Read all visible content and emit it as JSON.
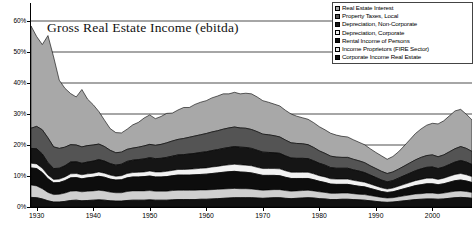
{
  "chart_data": {
    "type": "area",
    "stacked": true,
    "title": "Gross Real Estate Income (ebitda)",
    "xlabel": "",
    "ylabel": "",
    "ylim": [
      0,
      62
    ],
    "yticks": [
      "0%",
      "10%",
      "20%",
      "30%",
      "40%",
      "50%",
      "60%"
    ],
    "ytick_values": [
      0,
      10,
      20,
      30,
      40,
      50,
      60
    ],
    "xticks": [
      "1930",
      "1940",
      "1950",
      "1960",
      "1970",
      "1980",
      "1990",
      "2000"
    ],
    "xtick_values": [
      1930,
      1940,
      1950,
      1960,
      1970,
      1980,
      1990,
      2000
    ],
    "xlim": [
      1929,
      2007
    ],
    "grid": true,
    "legend_position": "top-right",
    "x": [
      1929,
      1930,
      1931,
      1932,
      1933,
      1934,
      1935,
      1936,
      1937,
      1938,
      1939,
      1940,
      1941,
      1942,
      1943,
      1944,
      1945,
      1946,
      1947,
      1948,
      1949,
      1950,
      1951,
      1952,
      1953,
      1954,
      1955,
      1956,
      1957,
      1958,
      1959,
      1960,
      1961,
      1962,
      1963,
      1964,
      1965,
      1966,
      1967,
      1968,
      1969,
      1970,
      1971,
      1972,
      1973,
      1974,
      1975,
      1976,
      1977,
      1978,
      1979,
      1980,
      1981,
      1982,
      1983,
      1984,
      1985,
      1986,
      1987,
      1988,
      1989,
      1990,
      1991,
      1992,
      1993,
      1994,
      1995,
      1996,
      1997,
      1998,
      1999,
      2000,
      2001,
      2002,
      2003,
      2004,
      2005,
      2006,
      2007
    ],
    "series": [
      {
        "name": "Corporate Income Real Estate",
        "fill": "#111111",
        "values": [
          3.1,
          3.0,
          2.6,
          2.0,
          1.6,
          1.6,
          1.8,
          2.1,
          2.2,
          2.0,
          2.1,
          2.2,
          2.3,
          2.2,
          2.0,
          1.9,
          1.9,
          2.1,
          2.2,
          2.2,
          2.2,
          2.3,
          2.2,
          2.2,
          2.2,
          2.3,
          2.4,
          2.4,
          2.4,
          2.4,
          2.5,
          2.5,
          2.6,
          2.7,
          2.8,
          2.9,
          3.0,
          3.0,
          3.0,
          3.0,
          2.9,
          2.8,
          2.9,
          3.0,
          3.0,
          2.8,
          2.7,
          2.8,
          2.9,
          3.0,
          2.9,
          2.7,
          2.6,
          2.4,
          2.4,
          2.5,
          2.5,
          2.4,
          2.3,
          2.2,
          2.0,
          1.8,
          1.6,
          1.5,
          1.6,
          1.8,
          2.0,
          2.2,
          2.4,
          2.5,
          2.6,
          2.6,
          2.5,
          2.6,
          2.8,
          3.0,
          3.1,
          3.0,
          2.8
        ]
      },
      {
        "name": "Income Proprietors (FIRE Sector)",
        "fill": "#cfcfcf",
        "values": [
          4.0,
          3.8,
          3.3,
          2.7,
          2.4,
          2.5,
          2.7,
          3.0,
          3.0,
          2.9,
          3.0,
          3.0,
          3.1,
          3.0,
          2.8,
          2.7,
          2.7,
          2.9,
          3.0,
          3.0,
          3.0,
          3.0,
          2.9,
          2.9,
          2.9,
          3.0,
          3.0,
          3.0,
          3.0,
          3.0,
          3.0,
          3.0,
          3.0,
          3.0,
          3.0,
          3.0,
          3.0,
          2.9,
          2.9,
          2.8,
          2.7,
          2.6,
          2.6,
          2.6,
          2.6,
          2.5,
          2.4,
          2.4,
          2.4,
          2.4,
          2.3,
          2.2,
          2.1,
          2.0,
          2.0,
          2.0,
          2.0,
          1.9,
          1.8,
          1.8,
          1.7,
          1.6,
          1.5,
          1.4,
          1.4,
          1.5,
          1.6,
          1.7,
          1.8,
          1.8,
          1.9,
          1.9,
          1.8,
          1.9,
          2.0,
          2.1,
          2.1,
          2.0,
          1.9
        ]
      },
      {
        "name": "Rental Income of Persons",
        "fill": "#0d0d0d",
        "values": [
          5.5,
          5.6,
          5.2,
          4.4,
          3.8,
          3.8,
          4.0,
          4.3,
          4.3,
          4.2,
          4.3,
          4.4,
          4.5,
          4.4,
          4.2,
          4.1,
          4.2,
          4.4,
          4.5,
          4.5,
          4.6,
          4.7,
          4.6,
          4.6,
          4.7,
          4.8,
          4.9,
          4.9,
          4.9,
          5.0,
          5.0,
          5.1,
          5.2,
          5.3,
          5.4,
          5.5,
          5.5,
          5.4,
          5.3,
          5.2,
          5.0,
          4.8,
          4.7,
          4.6,
          4.5,
          4.3,
          4.1,
          4.0,
          3.9,
          3.8,
          3.6,
          3.4,
          3.2,
          3.0,
          2.9,
          2.8,
          2.8,
          2.7,
          2.6,
          2.5,
          2.3,
          2.1,
          1.9,
          1.8,
          1.9,
          2.1,
          2.3,
          2.5,
          2.7,
          2.9,
          3.0,
          3.0,
          2.9,
          3.0,
          3.2,
          3.4,
          3.5,
          3.4,
          3.2
        ]
      },
      {
        "name": "Depreciation, Corporate",
        "fill": "#f2f2f2",
        "values": [
          1.5,
          1.5,
          1.4,
          1.2,
          1.1,
          1.1,
          1.2,
          1.3,
          1.3,
          1.3,
          1.3,
          1.3,
          1.4,
          1.3,
          1.3,
          1.2,
          1.3,
          1.4,
          1.4,
          1.5,
          1.5,
          1.6,
          1.6,
          1.6,
          1.7,
          1.7,
          1.8,
          1.8,
          1.9,
          1.9,
          2.0,
          2.0,
          2.1,
          2.1,
          2.2,
          2.2,
          2.3,
          2.3,
          2.3,
          2.3,
          2.2,
          2.2,
          2.2,
          2.2,
          2.2,
          2.1,
          2.0,
          2.0,
          2.0,
          2.0,
          1.9,
          1.8,
          1.8,
          1.7,
          1.7,
          1.7,
          1.7,
          1.6,
          1.6,
          1.5,
          1.4,
          1.3,
          1.2,
          1.1,
          1.2,
          1.3,
          1.4,
          1.5,
          1.6,
          1.7,
          1.8,
          1.8,
          1.7,
          1.8,
          1.9,
          2.0,
          2.1,
          2.0,
          1.9
        ]
      },
      {
        "name": "Depreciation, Non-Corporate",
        "fill": "#151515",
        "values": [
          4.8,
          4.9,
          4.6,
          4.0,
          3.5,
          3.5,
          3.6,
          3.8,
          3.8,
          3.7,
          3.8,
          3.9,
          4.0,
          3.9,
          3.7,
          3.6,
          3.7,
          3.9,
          4.0,
          4.1,
          4.2,
          4.3,
          4.3,
          4.4,
          4.5,
          4.6,
          4.7,
          4.8,
          4.9,
          5.0,
          5.1,
          5.2,
          5.3,
          5.4,
          5.5,
          5.6,
          5.7,
          5.7,
          5.7,
          5.6,
          5.5,
          5.3,
          5.2,
          5.1,
          5.0,
          4.8,
          4.6,
          4.5,
          4.5,
          4.4,
          4.2,
          4.0,
          3.8,
          3.6,
          3.5,
          3.5,
          3.5,
          3.4,
          3.3,
          3.1,
          2.9,
          2.7,
          2.5,
          2.3,
          2.4,
          2.6,
          2.8,
          3.0,
          3.2,
          3.4,
          3.5,
          3.6,
          3.5,
          3.6,
          3.8,
          4.0,
          4.2,
          4.1,
          3.9
        ]
      },
      {
        "name": "Property Taxes, Local",
        "fill": "#545454",
        "values": [
          6.5,
          7.2,
          7.8,
          8.0,
          7.0,
          6.4,
          6.0,
          5.6,
          5.4,
          5.3,
          5.3,
          5.2,
          5.0,
          4.7,
          4.3,
          4.0,
          3.9,
          3.9,
          3.9,
          4.0,
          4.2,
          4.3,
          4.3,
          4.5,
          4.7,
          4.9,
          5.0,
          5.2,
          5.4,
          5.6,
          5.7,
          5.9,
          6.0,
          6.1,
          6.2,
          6.3,
          6.3,
          6.2,
          6.2,
          6.1,
          6.0,
          5.8,
          5.7,
          5.5,
          5.3,
          5.1,
          4.9,
          4.8,
          4.7,
          4.5,
          4.3,
          4.0,
          3.8,
          3.7,
          3.6,
          3.5,
          3.5,
          3.4,
          3.3,
          3.2,
          3.0,
          2.9,
          2.8,
          2.7,
          2.8,
          2.9,
          3.1,
          3.3,
          3.5,
          3.7,
          3.8,
          3.9,
          3.8,
          3.9,
          4.1,
          4.3,
          4.5,
          4.4,
          4.2
        ]
      },
      {
        "name": "Real Estate Interest",
        "fill": "#a8a8a8",
        "values": [
          33.0,
          29.0,
          27.5,
          33.0,
          29.0,
          22.0,
          19.0,
          16.5,
          15.5,
          18.5,
          15.0,
          13.0,
          10.5,
          8.5,
          7.0,
          6.5,
          6.2,
          6.5,
          7.5,
          8.0,
          9.0,
          9.5,
          8.6,
          9.0,
          9.5,
          9.0,
          9.5,
          10.0,
          9.6,
          10.2,
          10.5,
          10.6,
          11.0,
          11.2,
          11.4,
          11.0,
          11.2,
          11.0,
          11.3,
          11.5,
          11.2,
          10.8,
          10.5,
          10.2,
          10.0,
          9.6,
          9.3,
          8.8,
          8.4,
          8.2,
          8.0,
          7.8,
          7.6,
          7.4,
          7.1,
          6.8,
          6.6,
          6.3,
          6.0,
          5.8,
          5.5,
          5.2,
          5.0,
          4.6,
          5.0,
          5.6,
          6.5,
          7.5,
          8.5,
          9.2,
          9.8,
          10.2,
          10.6,
          11.0,
          11.6,
          12.2,
          12.0,
          11.0,
          10.2
        ]
      }
    ]
  },
  "legend": {
    "items": [
      {
        "label": "Real Estate Interest",
        "fill": "#a8a8a8"
      },
      {
        "label": "Property Taxes, Local",
        "fill": "#545454"
      },
      {
        "label": "Depreciation, Non-Corporate",
        "fill": "#151515"
      },
      {
        "label": "Depreciation, Corporate",
        "fill": "#f2f2f2"
      },
      {
        "label": "Rental Income of Persons",
        "fill": "#0d0d0d"
      },
      {
        "label": "Income Proprietors (FIRE Sector)",
        "fill": "#e8e8e8"
      },
      {
        "label": "Corporate Income Real Estate",
        "fill": "#111111"
      }
    ]
  }
}
